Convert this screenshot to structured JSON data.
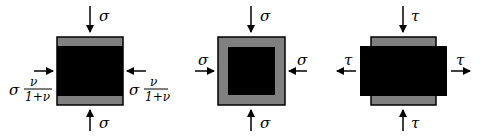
{
  "colors": {
    "black": "#000000",
    "gray": "#808080",
    "bg": "#ffffff"
  },
  "panel1": {
    "top_label": "σ",
    "bottom_label": "σ",
    "left_sym": "σ",
    "right_sym": "σ",
    "frac_num": "ν",
    "frac_den": "1+ν"
  },
  "panel2": {
    "top_label": "σ",
    "bottom_label": "σ",
    "left_label": "σ",
    "right_label": "σ"
  },
  "panel3": {
    "top_label": "τ",
    "bottom_label": "τ",
    "left_label": "τ",
    "right_label": "τ"
  }
}
